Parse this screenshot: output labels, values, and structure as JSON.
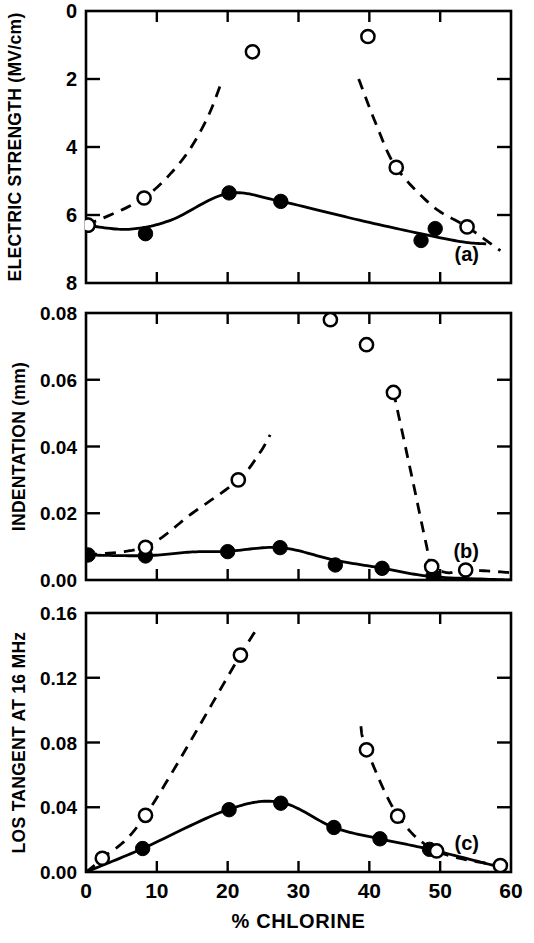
{
  "figure": {
    "xaxis_title": "% CHLORINE",
    "panels": [
      {
        "label": "(a)",
        "ylabel": "ELECTRIC STRENGTH (MV/cm)"
      },
      {
        "label": "(b)",
        "ylabel": "INDENTATION (mm)"
      },
      {
        "label": "(c)",
        "ylabel": "LOS TANGENT AT 16 MHz"
      }
    ],
    "ink": "#000000",
    "background": "#ffffff"
  },
  "chart_data": [
    {
      "type": "scatter",
      "title": "",
      "panel": "(a)",
      "xlabel": "% CHLORINE",
      "ylabel": "ELECTRIC STRENGTH (MV/cm)",
      "xlim": [
        0,
        60
      ],
      "ylim": [
        0,
        8
      ],
      "xticks": [
        0,
        10,
        20,
        30,
        40,
        50,
        60
      ],
      "xticklabels": [
        "0",
        "10",
        "20",
        "30",
        "40",
        "50",
        "60"
      ],
      "yticks": [
        0,
        2,
        4,
        6,
        8
      ],
      "yticklabels": [
        "0",
        "2",
        "4",
        "6",
        "8"
      ],
      "grid": false,
      "legend": "none",
      "series": [
        {
          "name": "filled-circles",
          "marker": "filled-circle",
          "line": "solid",
          "points": [
            {
              "x": 0.3,
              "y": 6.3
            },
            {
              "x": 8.4,
              "y": 6.55
            },
            {
              "x": 20.2,
              "y": 5.35
            },
            {
              "x": 27.5,
              "y": 5.6
            },
            {
              "x": 47.3,
              "y": 6.75
            },
            {
              "x": 49.3,
              "y": 6.4
            }
          ],
          "curve": [
            {
              "x": 0.0,
              "y": 6.3
            },
            {
              "x": 6.0,
              "y": 6.42
            },
            {
              "x": 12.0,
              "y": 6.15
            },
            {
              "x": 20.0,
              "y": 5.37
            },
            {
              "x": 27.5,
              "y": 5.6
            },
            {
              "x": 40.0,
              "y": 6.22
            },
            {
              "x": 52.0,
              "y": 6.75
            },
            {
              "x": 56.5,
              "y": 6.85
            }
          ]
        },
        {
          "name": "open-circles",
          "marker": "open-circle",
          "line": "dashed",
          "points": [
            {
              "x": 0.3,
              "y": 6.3
            },
            {
              "x": 8.2,
              "y": 5.5
            },
            {
              "x": 23.5,
              "y": 1.2
            },
            {
              "x": 39.8,
              "y": 0.75
            },
            {
              "x": 43.8,
              "y": 4.6
            },
            {
              "x": 53.8,
              "y": 6.35
            }
          ],
          "curve_left": [
            {
              "x": 0.0,
              "y": 6.3
            },
            {
              "x": 8.0,
              "y": 5.52
            },
            {
              "x": 13.5,
              "y": 4.4
            },
            {
              "x": 17.0,
              "y": 3.2
            },
            {
              "x": 19.2,
              "y": 2.05
            }
          ],
          "curve_right": [
            {
              "x": 38.5,
              "y": 2.0
            },
            {
              "x": 41.0,
              "y": 3.35
            },
            {
              "x": 43.8,
              "y": 4.6
            },
            {
              "x": 49.0,
              "y": 5.75
            },
            {
              "x": 53.8,
              "y": 6.35
            },
            {
              "x": 58.5,
              "y": 7.05
            }
          ]
        }
      ]
    },
    {
      "type": "scatter",
      "title": "",
      "panel": "(b)",
      "xlabel": "% CHLORINE",
      "ylabel": "INDENTATION (mm)",
      "xlim": [
        0,
        60
      ],
      "ylim": [
        0.08,
        0.0
      ],
      "y_inverted": true,
      "xticks": [
        0,
        10,
        20,
        30,
        40,
        50,
        60
      ],
      "xticklabels": [
        "0",
        "10",
        "20",
        "30",
        "40",
        "50",
        "60"
      ],
      "yticks": [
        0.0,
        0.02,
        0.04,
        0.06,
        0.08
      ],
      "yticklabels": [
        "0.00",
        "0.02",
        "0.04",
        "0.06",
        "0.08"
      ],
      "grid": false,
      "legend": "none",
      "series": [
        {
          "name": "filled-circles",
          "marker": "filled-circle",
          "line": "solid",
          "points": [
            {
              "x": 0.3,
              "y": 0.0075
            },
            {
              "x": 8.4,
              "y": 0.0072
            },
            {
              "x": 20.0,
              "y": 0.0085
            },
            {
              "x": 27.4,
              "y": 0.0097
            },
            {
              "x": 35.2,
              "y": 0.0045
            },
            {
              "x": 41.8,
              "y": 0.0035
            },
            {
              "x": 49.0,
              "y": 0.0012
            }
          ],
          "curve": [
            {
              "x": 0.0,
              "y": 0.0075
            },
            {
              "x": 8.5,
              "y": 0.0073
            },
            {
              "x": 15.0,
              "y": 0.0084
            },
            {
              "x": 20.0,
              "y": 0.0086
            },
            {
              "x": 27.5,
              "y": 0.0097
            },
            {
              "x": 35.0,
              "y": 0.006
            },
            {
              "x": 42.0,
              "y": 0.0035
            },
            {
              "x": 49.0,
              "y": 0.001
            },
            {
              "x": 60.0,
              "y": 0.0
            }
          ]
        },
        {
          "name": "open-circles",
          "marker": "open-circle",
          "line": "dashed",
          "points": [
            {
              "x": 8.4,
              "y": 0.0098
            },
            {
              "x": 21.5,
              "y": 0.03
            },
            {
              "x": 34.5,
              "y": 0.078
            },
            {
              "x": 39.6,
              "y": 0.0705
            },
            {
              "x": 43.4,
              "y": 0.0562
            },
            {
              "x": 48.8,
              "y": 0.004
            },
            {
              "x": 53.6,
              "y": 0.003
            }
          ],
          "curve_left": [
            {
              "x": 0.0,
              "y": 0.0075
            },
            {
              "x": 8.4,
              "y": 0.01
            },
            {
              "x": 15.0,
              "y": 0.02
            },
            {
              "x": 21.5,
              "y": 0.03
            },
            {
              "x": 24.5,
              "y": 0.038
            },
            {
              "x": 26.0,
              "y": 0.0435
            }
          ],
          "curve_right": [
            {
              "x": 43.4,
              "y": 0.0565
            },
            {
              "x": 46.0,
              "y": 0.031
            },
            {
              "x": 48.0,
              "y": 0.011
            },
            {
              "x": 48.8,
              "y": 0.0045
            },
            {
              "x": 51.0,
              "y": 0.0022
            },
            {
              "x": 53.6,
              "y": 0.003
            },
            {
              "x": 60.0,
              "y": 0.0022
            }
          ]
        }
      ]
    },
    {
      "type": "scatter",
      "title": "",
      "panel": "(c)",
      "xlabel": "% CHLORINE",
      "ylabel": "LOS TANGENT AT 16 MHz",
      "xlim": [
        0,
        60
      ],
      "ylim": [
        0.16,
        0.0
      ],
      "y_inverted": true,
      "xticks": [
        0,
        10,
        20,
        30,
        40,
        50,
        60
      ],
      "xticklabels": [
        "0",
        "10",
        "20",
        "30",
        "40",
        "50",
        "60"
      ],
      "yticks": [
        0.0,
        0.04,
        0.08,
        0.12,
        0.16
      ],
      "yticklabels": [
        "0.00",
        "0.04",
        "0.08",
        "0.12",
        "0.16"
      ],
      "grid": false,
      "legend": "none",
      "series": [
        {
          "name": "filled-circles",
          "marker": "filled-circle",
          "line": "solid",
          "points": [
            {
              "x": 8.0,
              "y": 0.0145
            },
            {
              "x": 20.2,
              "y": 0.0385
            },
            {
              "x": 27.5,
              "y": 0.0425
            },
            {
              "x": 35.0,
              "y": 0.0275
            },
            {
              "x": 41.5,
              "y": 0.0205
            },
            {
              "x": 48.5,
              "y": 0.014
            }
          ],
          "curve": [
            {
              "x": 0.0,
              "y": 0.0
            },
            {
              "x": 8.0,
              "y": 0.0145
            },
            {
              "x": 20.0,
              "y": 0.0385
            },
            {
              "x": 27.5,
              "y": 0.043
            },
            {
              "x": 35.0,
              "y": 0.0275
            },
            {
              "x": 41.5,
              "y": 0.0205
            },
            {
              "x": 48.5,
              "y": 0.014
            },
            {
              "x": 58.5,
              "y": 0.003
            }
          ]
        },
        {
          "name": "open-circles",
          "marker": "open-circle",
          "line": "dashed",
          "points": [
            {
              "x": 2.3,
              "y": 0.0085
            },
            {
              "x": 8.4,
              "y": 0.035
            },
            {
              "x": 21.8,
              "y": 0.134
            },
            {
              "x": 39.6,
              "y": 0.0755
            },
            {
              "x": 44.0,
              "y": 0.0345
            },
            {
              "x": 49.5,
              "y": 0.013
            },
            {
              "x": 58.5,
              "y": 0.004
            }
          ],
          "curve_left": [
            {
              "x": 0.0,
              "y": 0.0
            },
            {
              "x": 2.3,
              "y": 0.0085
            },
            {
              "x": 8.4,
              "y": 0.035
            },
            {
              "x": 21.8,
              "y": 0.134
            },
            {
              "x": 24.5,
              "y": 0.152
            }
          ],
          "curve_right": [
            {
              "x": 38.8,
              "y": 0.09
            },
            {
              "x": 39.6,
              "y": 0.076
            },
            {
              "x": 44.0,
              "y": 0.035
            },
            {
              "x": 49.5,
              "y": 0.013
            },
            {
              "x": 58.5,
              "y": 0.004
            },
            {
              "x": 62.0,
              "y": 0.003
            }
          ]
        }
      ]
    }
  ]
}
